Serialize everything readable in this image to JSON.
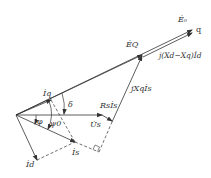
{
  "diagram": {
    "type": "phasor-diagram",
    "labels": {
      "E0": "Ė₀",
      "q_axis": "q",
      "EQ": "ĖQ",
      "jXdXqId": "j(Xd−Xq)İd",
      "jXqIs": "jXqİs",
      "Iq": "İq",
      "delta": "δ",
      "RsIs": "Rsİs",
      "phi": "φ",
      "psi0": "ψ0",
      "Us": "U̇s",
      "Is": "İs",
      "Id": "İd"
    },
    "colors": {
      "line": "#333333",
      "background": "#ffffff"
    }
  }
}
